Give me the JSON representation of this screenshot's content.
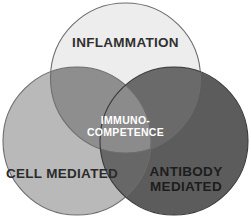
{
  "diagram": {
    "type": "venn",
    "title": "",
    "background_color": "#ffffff",
    "sets": [
      {
        "id": "inflammation",
        "label": "INFLAMMATION",
        "position": "top",
        "fill_color": "#ededed",
        "stroke_color": "#6d6d6d",
        "label_color": "#303030"
      },
      {
        "id": "cell-mediated",
        "label": "CELL MEDIATED",
        "position": "bottom-left",
        "fill_color": "#b9b9b9",
        "stroke_color": "#6d6d6d",
        "label_color": "#2b2b2b"
      },
      {
        "id": "antibody-mediated",
        "label_line1": "ANTIBODY",
        "label_line2": "MEDIATED",
        "position": "bottom-right",
        "fill_color": "#5c5c5c",
        "stroke_color": "#3a3a3a",
        "label_color": "#1d1d1d"
      }
    ],
    "intersections": {
      "top_left": {
        "label": "",
        "fill_color": "#8e8e8e"
      },
      "top_right": {
        "label": "",
        "fill_color": "#6a6a6a"
      },
      "bottom": {
        "label": "",
        "fill_color": "#676767"
      },
      "center": {
        "label_line1": "IMMUNO-",
        "label_line2": "COMPETENCE",
        "fill_color": "#8b8b8b",
        "label_color": "#ffffff"
      }
    }
  }
}
